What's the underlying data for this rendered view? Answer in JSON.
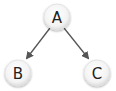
{
  "diagram": {
    "type": "tree",
    "nodes": [
      {
        "id": "A",
        "label": "A",
        "cx": 57,
        "cy": 17
      },
      {
        "id": "B",
        "label": "B",
        "cx": 18,
        "cy": 73
      },
      {
        "id": "C",
        "label": "C",
        "cx": 97,
        "cy": 73
      }
    ],
    "edges": [
      {
        "from": "A",
        "to": "B"
      },
      {
        "from": "A",
        "to": "C"
      }
    ],
    "colors": {
      "node_fill": "#f4f4f4",
      "node_stroke": "#d8d8d8",
      "edge": "#555555",
      "label": "#222222"
    }
  }
}
